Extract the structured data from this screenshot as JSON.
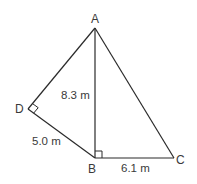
{
  "diagram": {
    "type": "geometry",
    "points": {
      "A": {
        "label": "A",
        "x": 95,
        "y": 28
      },
      "B": {
        "label": "B",
        "x": 95,
        "y": 158
      },
      "C": {
        "label": "C",
        "x": 174,
        "y": 158
      },
      "D": {
        "label": "D",
        "x": 28,
        "y": 109
      }
    },
    "segments": [
      {
        "from": "A",
        "to": "B"
      },
      {
        "from": "A",
        "to": "C"
      },
      {
        "from": "B",
        "to": "C"
      },
      {
        "from": "A",
        "to": "D"
      },
      {
        "from": "D",
        "to": "B"
      }
    ],
    "measurements": {
      "AB": "8.3 m",
      "DB": "5.0 m",
      "BC": "6.1 m"
    },
    "right_angles": [
      "D",
      "B"
    ]
  }
}
